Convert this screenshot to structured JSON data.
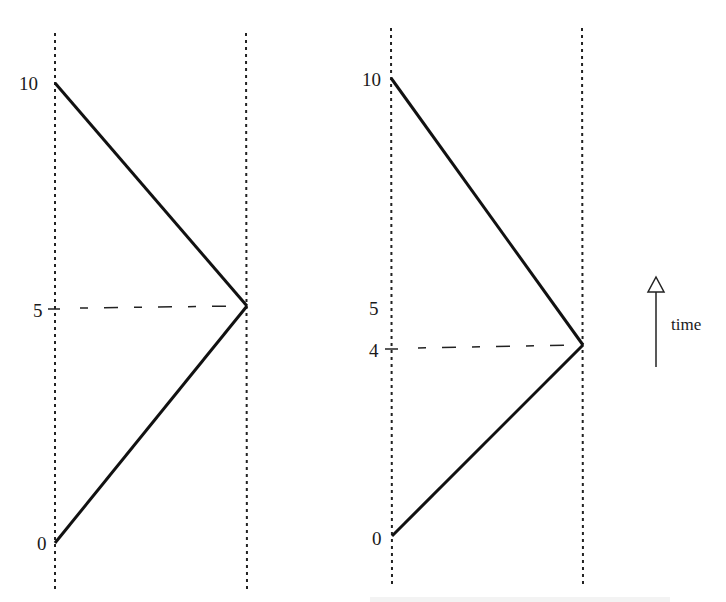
{
  "figure": {
    "panels": [
      {
        "id": "left",
        "axis_labels": {
          "top": "10",
          "mid": "5",
          "bottom": "0"
        },
        "start_value": 0,
        "end_value": 10,
        "meet_value": 5,
        "meet_label": "5"
      },
      {
        "id": "right",
        "axis_labels": {
          "top": "10",
          "mid": "5",
          "meet": "4",
          "bottom": "0"
        },
        "start_value": 0,
        "end_value": 10,
        "meet_value": 4,
        "meet_label": "4"
      }
    ],
    "arrow": {
      "label": "time",
      "direction": "up",
      "icon": "arrow-up-hollow-head"
    }
  }
}
